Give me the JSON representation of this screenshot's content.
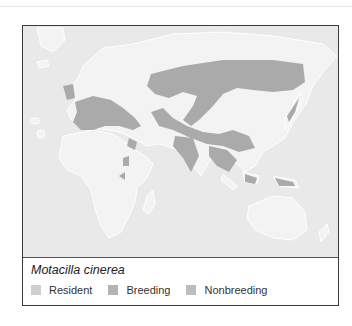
{
  "figure": {
    "species_name": "Motacilla cinerea",
    "legend": [
      {
        "label": "Resident",
        "color": "#cfcfcf"
      },
      {
        "label": "Breeding",
        "color": "#b3b3b3"
      },
      {
        "label": "Nonbreeding",
        "color": "#bdbdbd"
      }
    ]
  },
  "map": {
    "ocean_color": "#e9e9e9",
    "land_color": "#f2f2f2",
    "range_color": "#a9a9a9",
    "coast_color": "#ffffff"
  }
}
